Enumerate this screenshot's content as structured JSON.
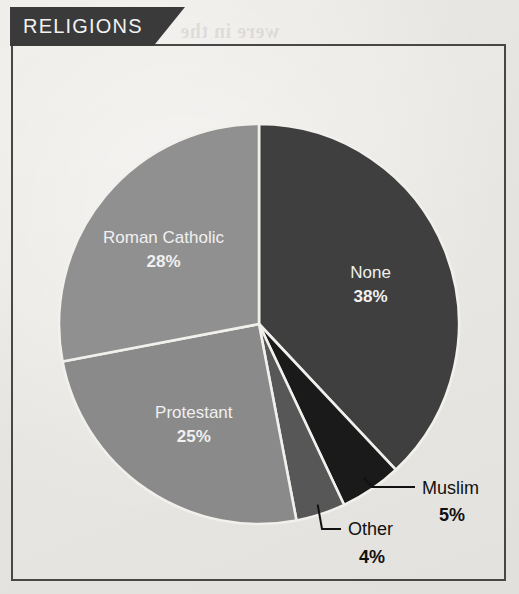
{
  "header": {
    "banner_title": "RELIGIONS"
  },
  "colors": {
    "banner_bg": "#3a3a3a",
    "panel_border": "#474747",
    "paper": "#e9e7e3",
    "none": "#3f3f3f",
    "muslim": "#1a1a1a",
    "other": "#575757",
    "protestant": "#8a8a8a",
    "roman_catholic": "#909090",
    "separator": "#f2f0ec",
    "label_light": "#f0f0f0",
    "label_dark": "#111111"
  },
  "chart_data": {
    "type": "pie",
    "title": "RELIGIONS",
    "start_angle_deg": 0,
    "direction": "clockwise",
    "units": "%",
    "categories": [
      "None",
      "Muslim",
      "Other",
      "Protestant",
      "Roman Catholic"
    ],
    "values": [
      38,
      5,
      4,
      25,
      28
    ],
    "labels": [
      "None",
      "Muslim",
      "Other",
      "Protestant",
      "Roman Catholic"
    ],
    "value_labels": [
      "38%",
      "5%",
      "4%",
      "25%",
      "28%"
    ],
    "colors": [
      "#3f3f3f",
      "#1a1a1a",
      "#575757",
      "#8a8a8a",
      "#909090"
    ],
    "label_placement": [
      "inside",
      "callout",
      "callout",
      "inside",
      "inside"
    ],
    "legend": "none",
    "grid": false,
    "slices": [
      {
        "name": "None",
        "value": 38,
        "value_label": "38%",
        "color": "#3f3f3f",
        "placement": "inside"
      },
      {
        "name": "Muslim",
        "value": 5,
        "value_label": "5%",
        "color": "#1a1a1a",
        "placement": "callout"
      },
      {
        "name": "Other",
        "value": 4,
        "value_label": "4%",
        "color": "#575757",
        "placement": "callout"
      },
      {
        "name": "Protestant",
        "value": 25,
        "value_label": "25%",
        "color": "#8a8a8a",
        "placement": "inside"
      },
      {
        "name": "Roman Catholic",
        "value": 28,
        "value_label": "28%",
        "color": "#909090",
        "placement": "inside"
      }
    ]
  },
  "bleed_text": {
    "line1": "Christianity",
    "line2": "also was a major",
    "line3": "were in the",
    "line4": "countries with",
    "line5": "of the world",
    "line6": "nonbelievers",
    "line7": "and non-religious"
  }
}
